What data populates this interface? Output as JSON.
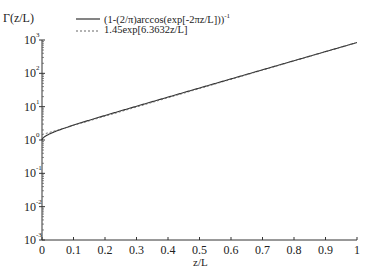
{
  "chart_data": {
    "type": "line",
    "title": "",
    "ylabel": "Γ(z/L)",
    "xlabel": "z/L",
    "xlim": [
      0,
      1
    ],
    "ylim": [
      0.001,
      1000
    ],
    "yscale": "log",
    "grid": false,
    "legend_position": "top-center",
    "x_ticks": [
      "0",
      "0.1",
      "0.2",
      "0.3",
      "0.4",
      "0.5",
      "0.6",
      "0.7",
      "0.8",
      "0.9",
      "1"
    ],
    "y_ticks": [
      {
        "base": "10",
        "exp": "3"
      },
      {
        "base": "10",
        "exp": "2"
      },
      {
        "base": "10",
        "exp": "1"
      },
      {
        "base": "10",
        "exp": "0"
      },
      {
        "base": "10",
        "exp": "-1"
      },
      {
        "base": "10",
        "exp": "-2"
      },
      {
        "base": "10",
        "exp": "-3"
      }
    ],
    "series": [
      {
        "name": "(1-(2/π)arccos(exp[-2πz/L]))",
        "name_superscript": "-1",
        "style": "solid",
        "x": [
          0,
          0.01,
          0.02,
          0.05,
          0.1,
          0.2,
          0.3,
          0.4,
          0.5,
          0.6,
          0.7,
          0.8,
          0.9,
          1.0
        ],
        "values": [
          1.0,
          1.28,
          1.42,
          1.84,
          2.7,
          5.2,
          9.8,
          18.4,
          34.5,
          64.6,
          121,
          227,
          425,
          796
        ]
      },
      {
        "name": "1.45exp[6.3632z/L]",
        "style": "dashed",
        "x": [
          0,
          0.01,
          0.02,
          0.05,
          0.1,
          0.2,
          0.3,
          0.4,
          0.5,
          0.6,
          0.7,
          0.8,
          0.9,
          1.0
        ],
        "values": [
          1.45,
          1.55,
          1.65,
          1.99,
          2.74,
          5.17,
          9.77,
          18.5,
          34.9,
          65.9,
          124,
          235,
          444,
          839
        ]
      }
    ]
  }
}
